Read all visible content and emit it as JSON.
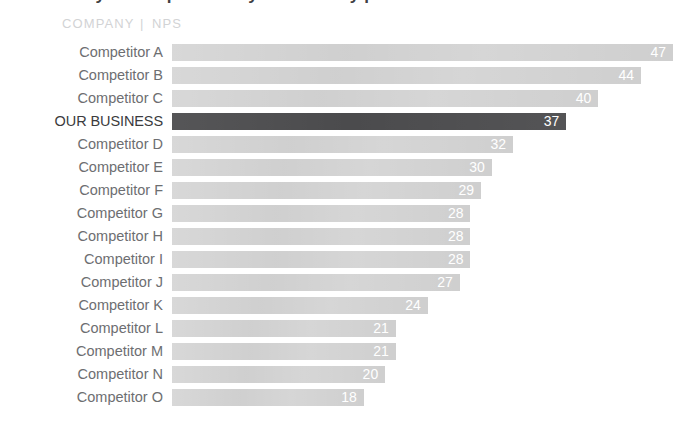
{
  "header": {
    "title": "How do you compare with your industry peers?",
    "company_column": "COMPANY",
    "separator": "|",
    "nps_column": "NPS"
  },
  "colors": {
    "bar_default": "#cdcdcd",
    "bar_highlight": "#4b4b4d",
    "label_text": "#6d6e71",
    "header_text": "#d2d3d5",
    "value_text": "#ffffff",
    "background": "#ffffff"
  },
  "chart_data": {
    "type": "bar",
    "orientation": "horizontal",
    "title": "How do you compare with your industry peers?",
    "xlabel": "NPS",
    "ylabel": "COMPANY",
    "xlim": [
      0,
      47
    ],
    "grid": false,
    "legend": false,
    "highlight_category": "OUR BUSINESS",
    "categories": [
      "Competitor A",
      "Competitor B",
      "Competitor C",
      "OUR BUSINESS",
      "Competitor D",
      "Competitor E",
      "Competitor F",
      "Competitor G",
      "Competitor H",
      "Competitor I",
      "Competitor J",
      "Competitor K",
      "Competitor L",
      "Competitor M",
      "Competitor N",
      "Competitor O"
    ],
    "values": [
      47,
      44,
      40,
      37,
      32,
      30,
      29,
      28,
      28,
      28,
      27,
      24,
      21,
      21,
      20,
      18
    ],
    "rows": [
      {
        "label": "Competitor A",
        "value": 47,
        "highlight": false
      },
      {
        "label": "Competitor B",
        "value": 44,
        "highlight": false
      },
      {
        "label": "Competitor C",
        "value": 40,
        "highlight": false
      },
      {
        "label": "OUR BUSINESS",
        "value": 37,
        "highlight": true
      },
      {
        "label": "Competitor D",
        "value": 32,
        "highlight": false
      },
      {
        "label": "Competitor E",
        "value": 30,
        "highlight": false
      },
      {
        "label": "Competitor F",
        "value": 29,
        "highlight": false
      },
      {
        "label": "Competitor G",
        "value": 28,
        "highlight": false
      },
      {
        "label": "Competitor H",
        "value": 28,
        "highlight": false
      },
      {
        "label": "Competitor I",
        "value": 28,
        "highlight": false
      },
      {
        "label": "Competitor J",
        "value": 27,
        "highlight": false
      },
      {
        "label": "Competitor K",
        "value": 24,
        "highlight": false
      },
      {
        "label": "Competitor L",
        "value": 21,
        "highlight": false
      },
      {
        "label": "Competitor M",
        "value": 21,
        "highlight": false
      },
      {
        "label": "Competitor N",
        "value": 20,
        "highlight": false
      },
      {
        "label": "Competitor O",
        "value": 18,
        "highlight": false
      }
    ]
  },
  "layout": {
    "bar_origin_x": 172,
    "px_per_unit": 10.66
  }
}
